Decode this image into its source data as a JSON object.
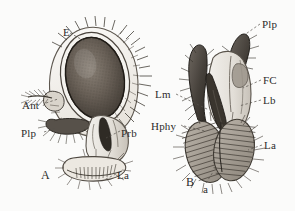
{
  "figure": {
    "background_color": "#fbfbfa",
    "ink_color": "#2b2b2b",
    "panels": [
      {
        "id": "A",
        "id_label": "A",
        "name": "lateral-view-of-head",
        "labels": [
          {
            "key": "E",
            "text": "E",
            "name": "label-eye",
            "x": 63,
            "y": 27
          },
          {
            "key": "Ant",
            "text": "Ant",
            "name": "label-antenna",
            "x": 22,
            "y": 100
          },
          {
            "key": "Plp",
            "text": "Plp",
            "name": "label-palp",
            "x": 21,
            "y": 128
          },
          {
            "key": "Prb",
            "text": "Prb",
            "name": "label-proboscis",
            "x": 121,
            "y": 128
          },
          {
            "key": "La",
            "text": "La",
            "name": "label-labellum",
            "x": 117,
            "y": 170
          }
        ],
        "panel_id_pos": {
          "x": 41,
          "y": 170
        }
      },
      {
        "id": "B",
        "id_label": "B",
        "name": "anterior-view-of-proboscis",
        "labels": [
          {
            "key": "Plp",
            "text": "Plp",
            "name": "label-palp",
            "x": 262,
            "y": 19
          },
          {
            "key": "FC",
            "text": "FC",
            "name": "label-food-canal",
            "x": 263,
            "y": 75
          },
          {
            "key": "Lb",
            "text": "Lb",
            "name": "label-labrum",
            "x": 263,
            "y": 95
          },
          {
            "key": "Lm",
            "text": "Lm",
            "name": "label-labium",
            "x": 155,
            "y": 89
          },
          {
            "key": "Hphy",
            "text": "Hphy",
            "name": "label-hypopharynx",
            "x": 151,
            "y": 121
          },
          {
            "key": "La",
            "text": "La",
            "name": "label-labellum",
            "x": 264,
            "y": 140
          },
          {
            "key": "a",
            "text": "a",
            "name": "label-pseudotrachea",
            "x": 203,
            "y": 184
          }
        ],
        "panel_id_pos": {
          "x": 186,
          "y": 177
        }
      }
    ]
  }
}
